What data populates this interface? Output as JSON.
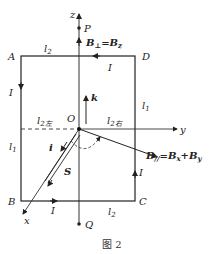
{
  "figure": {
    "caption": "图 2",
    "axes": {
      "z": "z",
      "y": "y",
      "x": "x",
      "origin": "O"
    },
    "points": {
      "P": "P",
      "Q": "Q",
      "A": "A",
      "B": "B",
      "C": "C",
      "D": "D"
    },
    "labels": {
      "l2_top": "l",
      "l2_top_sub": "2",
      "l2_bottom": "l",
      "l2_bottom_sub": "2",
      "l1_left": "l",
      "l1_left_sub": "1",
      "l1_right": "l",
      "l1_right_sub": "1",
      "l2_left_seg": "l",
      "l2_left_seg_sub": "2左",
      "l2_right_seg": "l",
      "l2_right_seg_sub": "2右",
      "current_top": "I",
      "current_left": "I",
      "current_right": "I",
      "current_bottom": "I",
      "unit_k": "k",
      "unit_i": "i",
      "area_S": "S",
      "B_perp": "B",
      "B_perp_sub": "⊥",
      "B_perp_eq": "=B",
      "B_perp_eq_sub": "z",
      "B_par": "B",
      "B_par_sub": "//",
      "B_par_eq1": "=B",
      "B_par_eq1_sub": "x",
      "B_par_eq2": "+B",
      "B_par_eq2_sub": "y"
    }
  }
}
